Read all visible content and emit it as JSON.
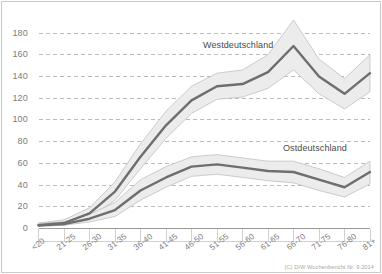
{
  "credit": "(C) DIW Wochenbericht Nr. 9.2014",
  "series_labels": {
    "west": "Westdeutschland",
    "east": "Ostdeutschland"
  },
  "chart_data": {
    "type": "line",
    "title": "",
    "subtitle": "",
    "xlabel": "",
    "ylabel": "",
    "ylim": [
      0,
      180
    ],
    "yticks": [
      0,
      20,
      40,
      60,
      80,
      100,
      120,
      140,
      160,
      180
    ],
    "ytick_labels": [
      "0",
      "20",
      "40",
      "60",
      "80",
      "100",
      "120",
      "140",
      "160",
      "180"
    ],
    "grid": true,
    "grid_style": "dashed",
    "legend_position": "inline-annotation",
    "categories": [
      "<20",
      "21-25",
      "26-30",
      "31-35",
      "36-40",
      "41-45",
      "46-50",
      "51-55",
      "56-60",
      "61-65",
      "66-70",
      "71-75",
      "76-80",
      "81+"
    ],
    "series": [
      {
        "name": "Westdeutschland",
        "values": [
          3,
          5,
          14,
          34,
          66,
          95,
          118,
          131,
          133,
          144,
          168,
          140,
          124,
          143
        ],
        "band_upper": [
          5,
          8,
          19,
          43,
          78,
          108,
          131,
          143,
          146,
          160,
          192,
          156,
          138,
          160
        ],
        "band_lower": [
          2,
          3,
          10,
          26,
          55,
          83,
          106,
          119,
          121,
          129,
          146,
          124,
          110,
          126
        ]
      },
      {
        "name": "Ostdeutschland",
        "values": [
          3,
          4,
          9,
          17,
          35,
          47,
          57,
          59,
          56,
          53,
          52,
          45,
          38,
          52
        ],
        "band_upper": [
          5,
          6,
          13,
          24,
          45,
          57,
          66,
          68,
          65,
          62,
          62,
          55,
          47,
          62
        ],
        "band_lower": [
          2,
          3,
          6,
          11,
          26,
          38,
          48,
          50,
          47,
          44,
          42,
          35,
          29,
          41
        ]
      }
    ]
  }
}
